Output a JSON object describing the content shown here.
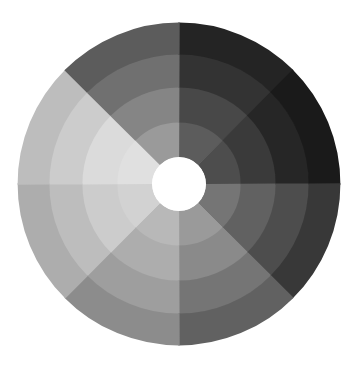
{
  "figure": {
    "title": "",
    "background_color": "#ffffff",
    "width": 360,
    "height": 373
  },
  "chart_data": {
    "type": "pie",
    "subtype": "radial-segmented-donut",
    "title": "",
    "subtitle": "",
    "xlabel": "",
    "ylabel": "",
    "legend": [],
    "legend_position": "none",
    "grid": false,
    "annotations": [],
    "center": {
      "x": 179,
      "y": 184
    },
    "hole_radius": 27,
    "hole_color": "#ffffff",
    "outer_radius": 161,
    "ring_radii": [
      27,
      62,
      97,
      130,
      161
    ],
    "ring_count": 4,
    "sector_count": 8,
    "start_angle_deg": -90,
    "sector_span_deg": 45,
    "sector_labels": [
      "sector-1",
      "sector-2",
      "sector-3",
      "sector-4",
      "sector-5",
      "sector-6",
      "sector-7",
      "sector-8"
    ],
    "ring_labels": [
      "ring-inner",
      "ring-mid-inner",
      "ring-mid-outer",
      "ring-outer"
    ],
    "categories": [
      "sector-1",
      "sector-2",
      "sector-3",
      "sector-4",
      "sector-5",
      "sector-6",
      "sector-7",
      "sector-8"
    ],
    "series": [
      {
        "name": "ring-inner",
        "values": [
          36,
          30,
          46,
          60,
          72,
          82,
          88,
          60
        ],
        "colors": [
          "#5c5c5c",
          "#4d4d4d",
          "#757575",
          "#9a9a9a",
          "#b8b8b8",
          "#d2d2d2",
          "#e0e0e0",
          "#9a9a9a"
        ]
      },
      {
        "name": "ring-mid-inner",
        "values": [
          28,
          22,
          38,
          54,
          68,
          80,
          86,
          52
        ],
        "colors": [
          "#484848",
          "#3a3a3a",
          "#616161",
          "#8a8a8a",
          "#adadad",
          "#cccccc",
          "#dbdbdb",
          "#858585"
        ]
      },
      {
        "name": "ring-mid-outer",
        "values": [
          20,
          15,
          30,
          46,
          62,
          74,
          80,
          44
        ],
        "colors": [
          "#333333",
          "#262626",
          "#4d4d4d",
          "#757575",
          "#9e9e9e",
          "#bdbdbd",
          "#cccccc",
          "#707070"
        ]
      },
      {
        "name": "ring-outer",
        "values": [
          14,
          10,
          22,
          38,
          55,
          68,
          74,
          36
        ],
        "colors": [
          "#242424",
          "#1a1a1a",
          "#383838",
          "#616161",
          "#8c8c8c",
          "#adadad",
          "#bdbdbd",
          "#5c5c5c"
        ]
      }
    ],
    "colors": {
      "lightest": "#e0e0e0",
      "darkest": "#1a1a1a",
      "hole": "#ffffff",
      "background": "#ffffff"
    },
    "value_range": [
      10,
      88
    ]
  }
}
